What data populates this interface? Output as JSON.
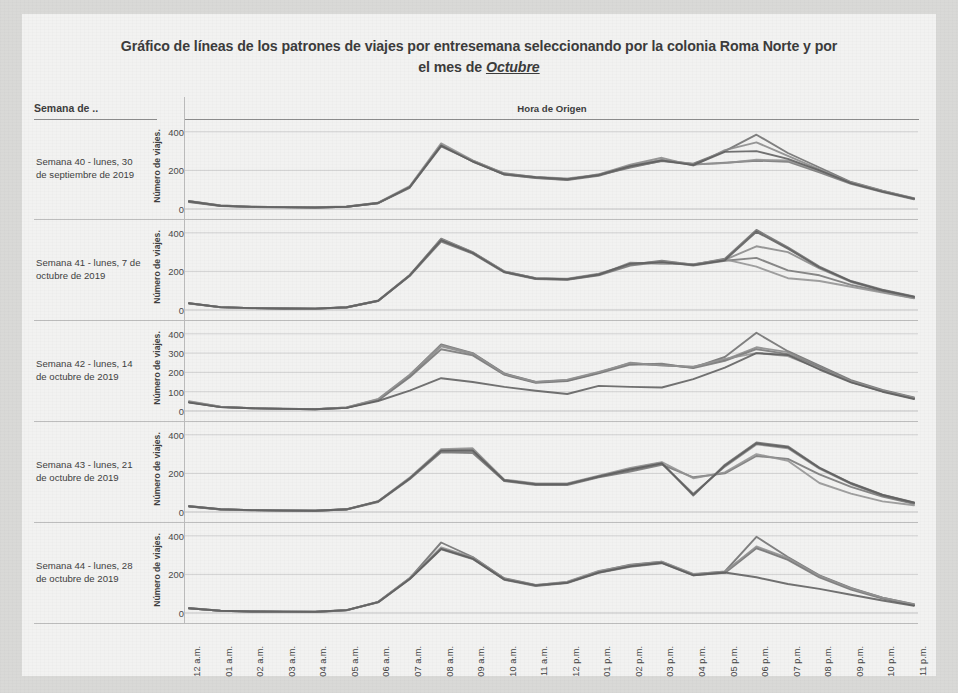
{
  "title": {
    "line1": "Gráfico de líneas de los patrones de viajes por entresemana seleccionando por la colonia Roma Norte y por",
    "line2_prefix": "el mes de ",
    "line2_emphasis": "Octubre"
  },
  "table": {
    "row_header_label": "Semana de ..",
    "column_header_label": "Hora de Origen",
    "y_axis_title": "Número de viajes."
  },
  "chart_data": {
    "type": "line",
    "title": "Gráfico de líneas de los patrones de viajes por entresemana seleccionando por la colonia Roma Norte y por el mes de Octubre",
    "xlabel": "Hora de Origen",
    "ylabel": "Número de viajes.",
    "grid": true,
    "legend": "none",
    "x": [
      "12 a.m.",
      "01 a.m.",
      "02 a.m.",
      "03 a.m.",
      "04 a.m.",
      "05 a.m.",
      "06 a.m.",
      "07 a.m.",
      "08 a.m.",
      "09 a.m.",
      "10 a.m.",
      "11 a.m.",
      "12 p.m.",
      "01 p.m.",
      "02 p.m.",
      "03 p.m.",
      "04 p.m.",
      "05 p.m.",
      "06 p.m.",
      "07 p.m.",
      "08 p.m.",
      "09 p.m.",
      "10 p.m.",
      "11 p.m."
    ],
    "panels": [
      {
        "label": "Semana 40 - lunes, 30 de septiembre de 2019",
        "ylim": [
          0,
          430
        ],
        "yticks": [
          0,
          200,
          400
        ],
        "ytick_labels": [
          "0",
          "200",
          "400"
        ],
        "series": [
          {
            "name": "lunes",
            "values": [
              40,
              18,
              12,
              10,
              8,
              12,
              30,
              110,
              330,
              250,
              185,
              165,
              155,
              175,
              215,
              250,
              235,
              300,
              385,
              290,
              215,
              140,
              95,
              55
            ]
          },
          {
            "name": "martes",
            "values": [
              38,
              16,
              11,
              9,
              8,
              12,
              32,
              115,
              335,
              245,
              180,
              162,
              152,
              180,
              230,
              265,
              225,
              305,
              345,
              275,
              205,
              135,
              92,
              52
            ]
          },
          {
            "name": "miércoles",
            "values": [
              36,
              15,
              10,
              9,
              7,
              11,
              30,
              112,
              325,
              248,
              178,
              160,
              150,
              172,
              220,
              248,
              230,
              240,
              250,
              245,
              190,
              130,
              88,
              50
            ]
          },
          {
            "name": "jueves",
            "values": [
              42,
              18,
              12,
              10,
              9,
              13,
              33,
              118,
              340,
              252,
              182,
              166,
              158,
              178,
              225,
              255,
              232,
              238,
              255,
              252,
              198,
              138,
              94,
              56
            ]
          },
          {
            "name": "viernes",
            "values": [
              40,
              17,
              11,
              10,
              8,
              12,
              31,
              114,
              328,
              246,
              180,
              164,
              154,
              176,
              222,
              252,
              228,
              296,
              300,
              260,
              200,
              134,
              90,
              54
            ]
          }
        ]
      },
      {
        "label": "Semana 41 - lunes, 7 de octubre de 2019",
        "ylim": [
          0,
          430
        ],
        "yticks": [
          0,
          200,
          400
        ],
        "ytick_labels": [
          "0",
          "200",
          "400"
        ],
        "series": [
          {
            "name": "lunes",
            "values": [
              35,
              15,
              10,
              8,
              7,
              14,
              48,
              180,
              370,
              300,
              200,
              165,
              160,
              185,
              235,
              255,
              235,
              265,
              415,
              325,
              225,
              150,
              105,
              70
            ]
          },
          {
            "name": "martes",
            "values": [
              33,
              14,
              9,
              8,
              6,
              13,
              46,
              178,
              360,
              295,
              198,
              162,
              158,
              182,
              245,
              240,
              238,
              260,
              330,
              300,
              215,
              145,
              100,
              66
            ]
          },
          {
            "name": "miércoles",
            "values": [
              34,
              14,
              10,
              8,
              7,
              13,
              47,
              176,
              355,
              292,
              195,
              160,
              156,
              180,
              230,
              250,
              230,
              255,
              270,
              205,
              180,
              130,
              95,
              62
            ]
          },
          {
            "name": "jueves",
            "values": [
              36,
              15,
              10,
              9,
              7,
              14,
              49,
              182,
              365,
              298,
              200,
              164,
              162,
              188,
              238,
              252,
              236,
              262,
              225,
              165,
              150,
              120,
              90,
              60
            ]
          },
          {
            "name": "viernes",
            "values": [
              35,
              15,
              10,
              8,
              7,
              14,
              48,
              179,
              362,
              296,
              197,
              163,
              159,
              184,
              240,
              248,
              233,
              258,
              405,
              318,
              220,
              148,
              102,
              68
            ]
          }
        ]
      },
      {
        "label": "Semana 42 - lunes, 14 de octubre de 2019",
        "ylim": [
          0,
          430
        ],
        "yticks": [
          0,
          100,
          200,
          300,
          400
        ],
        "ytick_labels": [
          "0",
          "100",
          "200",
          "300",
          "400"
        ],
        "series": [
          {
            "name": "lunes",
            "values": [
              48,
              22,
              15,
              12,
              10,
              18,
              60,
              185,
              345,
              300,
              195,
              150,
              160,
              200,
              245,
              240,
              225,
              280,
              405,
              310,
              235,
              160,
              110,
              70
            ]
          },
          {
            "name": "martes",
            "values": [
              46,
              20,
              14,
              11,
              9,
              16,
              58,
              180,
              335,
              295,
              190,
              148,
              158,
              198,
              250,
              235,
              230,
              265,
              330,
              305,
              230,
              155,
              105,
              66
            ]
          },
          {
            "name": "miércoles",
            "values": [
              45,
              20,
              14,
              11,
              9,
              16,
              55,
              175,
              320,
              288,
              188,
              146,
              155,
              195,
              240,
              245,
              222,
              260,
              320,
              295,
              225,
              150,
              102,
              64
            ]
          },
          {
            "name": "jueves",
            "values": [
              50,
              22,
              15,
              12,
              10,
              18,
              62,
              188,
              340,
              298,
              192,
              150,
              162,
              202,
              248,
              238,
              228,
              270,
              300,
              285,
              220,
              152,
              104,
              68
            ]
          },
          {
            "name": "viernes",
            "values": [
              44,
              20,
              14,
              11,
              9,
              16,
              52,
              105,
              170,
              150,
              125,
              105,
              88,
              130,
              125,
              122,
              165,
              225,
              300,
              290,
              215,
              148,
              100,
              62
            ]
          }
        ]
      },
      {
        "label": "Semana 43 - lunes, 21 de octubre de 2019",
        "ylim": [
          0,
          430
        ],
        "yticks": [
          0,
          200,
          400
        ],
        "ytick_labels": [
          "0",
          "200",
          "400"
        ],
        "series": [
          {
            "name": "lunes",
            "values": [
              30,
              14,
              10,
              8,
              6,
              14,
              55,
              175,
              320,
              325,
              165,
              145,
              145,
              185,
              225,
              255,
              85,
              245,
              360,
              340,
              230,
              150,
              90,
              50
            ]
          },
          {
            "name": "martes",
            "values": [
              29,
              13,
              9,
              7,
              6,
              13,
              54,
              172,
              315,
              312,
              162,
              143,
              143,
              182,
              215,
              250,
              95,
              235,
              350,
              330,
              225,
              145,
              85,
              45
            ]
          },
          {
            "name": "miércoles",
            "values": [
              28,
              13,
              9,
              7,
              6,
              13,
              52,
              170,
              310,
              305,
              160,
              140,
              140,
              180,
              210,
              245,
              180,
              200,
              290,
              275,
              195,
              130,
              80,
              42
            ]
          },
          {
            "name": "jueves",
            "values": [
              31,
              14,
              10,
              8,
              7,
              15,
              56,
              178,
              325,
              330,
              168,
              148,
              148,
              188,
              228,
              258,
              175,
              205,
              300,
              265,
              150,
              95,
              55,
              35
            ]
          },
          {
            "name": "viernes",
            "values": [
              30,
              14,
              10,
              8,
              6,
              14,
              55,
              174,
              318,
              318,
              164,
              144,
              144,
              184,
              220,
              252,
              90,
              240,
              355,
              335,
              228,
              148,
              88,
              48
            ]
          }
        ]
      },
      {
        "label": "Semana 44 - lunes, 28 de octubre de 2019",
        "ylim": [
          0,
          430
        ],
        "yticks": [
          0,
          200,
          400
        ],
        "ytick_labels": [
          "0",
          "200",
          "400"
        ],
        "series": [
          {
            "name": "lunes",
            "values": [
              25,
              12,
              8,
              7,
              6,
              15,
              58,
              180,
              365,
              290,
              180,
              145,
              160,
              215,
              250,
              265,
              200,
              215,
              395,
              290,
              195,
              130,
              80,
              45
            ]
          },
          {
            "name": "martes",
            "values": [
              24,
              11,
              8,
              6,
              5,
              14,
              56,
              178,
              335,
              285,
              175,
              142,
              158,
              212,
              245,
              262,
              198,
              212,
              340,
              280,
              190,
              125,
              78,
              42
            ]
          },
          {
            "name": "miércoles",
            "values": [
              24,
              11,
              8,
              6,
              5,
              14,
              55,
              175,
              330,
              280,
              172,
              140,
              155,
              208,
              240,
              258,
              195,
              208,
              335,
              275,
              185,
              122,
              75,
              40
            ]
          },
          {
            "name": "jueves",
            "values": [
              26,
              12,
              9,
              7,
              6,
              15,
              57,
              182,
              340,
              288,
              178,
              144,
              162,
              218,
              248,
              266,
              202,
              214,
              345,
              285,
              192,
              128,
              80,
              44
            ]
          },
          {
            "name": "viernes",
            "values": [
              25,
              12,
              8,
              7,
              6,
              15,
              56,
              176,
              332,
              282,
              174,
              143,
              157,
              210,
              242,
              260,
              196,
              210,
              185,
              150,
              125,
              95,
              65,
              38
            ]
          }
        ]
      }
    ]
  }
}
